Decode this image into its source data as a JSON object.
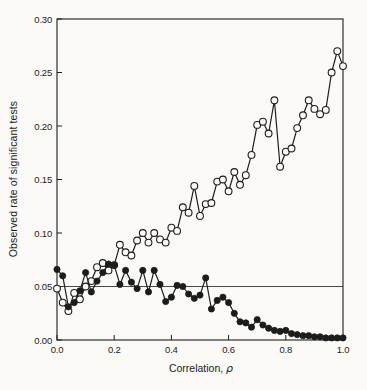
{
  "figure": {
    "background": "#fbfaf7",
    "ink_color": "#1c1c1c"
  },
  "axes": {
    "y_title": "Observed rate of significant tests",
    "x_title_prefix": "Correlation, ",
    "x_title_symbol": "ρ"
  },
  "chart_data": {
    "type": "line",
    "title": "",
    "xlabel": "Correlation, ρ",
    "ylabel": "Observed rate of significant tests",
    "xlim": [
      0.0,
      1.0
    ],
    "ylim": [
      0.0,
      0.3
    ],
    "grid": false,
    "legend": "none",
    "frame": "full-box",
    "reference_line_y": 0.05,
    "x_tick_values": [
      0.0,
      0.2,
      0.4,
      0.6,
      0.8,
      1.0
    ],
    "x_tick_labels": [
      "0.0",
      "0.2",
      "0.4",
      "0.6",
      "0.8",
      "1.0"
    ],
    "y_tick_values": [
      0.0,
      0.05,
      0.1,
      0.15,
      0.2,
      0.25,
      0.3
    ],
    "y_tick_labels": [
      "0.00",
      "0.05",
      "0.10",
      "0.15",
      "0.20",
      "0.25",
      "0.30"
    ],
    "series": [
      {
        "name": "increasing-series",
        "marker": "open-circle",
        "x": [
          0.0,
          0.02,
          0.04,
          0.06,
          0.08,
          0.1,
          0.12,
          0.14,
          0.16,
          0.18,
          0.2,
          0.22,
          0.24,
          0.26,
          0.28,
          0.3,
          0.32,
          0.34,
          0.36,
          0.38,
          0.4,
          0.42,
          0.44,
          0.46,
          0.48,
          0.5,
          0.52,
          0.54,
          0.56,
          0.58,
          0.6,
          0.62,
          0.64,
          0.66,
          0.68,
          0.7,
          0.72,
          0.74,
          0.76,
          0.78,
          0.8,
          0.82,
          0.84,
          0.86,
          0.88,
          0.9,
          0.92,
          0.94,
          0.96,
          0.98,
          1.0
        ],
        "values": [
          0.048,
          0.035,
          0.027,
          0.044,
          0.038,
          0.05,
          0.055,
          0.068,
          0.072,
          0.065,
          0.07,
          0.089,
          0.082,
          0.079,
          0.093,
          0.1,
          0.091,
          0.1,
          0.094,
          0.091,
          0.105,
          0.102,
          0.124,
          0.119,
          0.144,
          0.116,
          0.127,
          0.128,
          0.148,
          0.15,
          0.139,
          0.157,
          0.145,
          0.154,
          0.173,
          0.201,
          0.204,
          0.193,
          0.224,
          0.162,
          0.176,
          0.179,
          0.198,
          0.21,
          0.224,
          0.216,
          0.211,
          0.215,
          0.25,
          0.27,
          0.256
        ]
      },
      {
        "name": "decreasing-series",
        "marker": "filled-circle",
        "x": [
          0.0,
          0.02,
          0.04,
          0.06,
          0.08,
          0.1,
          0.12,
          0.14,
          0.16,
          0.18,
          0.2,
          0.22,
          0.24,
          0.26,
          0.28,
          0.3,
          0.32,
          0.34,
          0.36,
          0.38,
          0.4,
          0.42,
          0.44,
          0.46,
          0.48,
          0.5,
          0.52,
          0.54,
          0.56,
          0.58,
          0.6,
          0.62,
          0.64,
          0.66,
          0.68,
          0.7,
          0.72,
          0.74,
          0.76,
          0.78,
          0.8,
          0.82,
          0.84,
          0.86,
          0.88,
          0.9,
          0.92,
          0.94,
          0.96,
          0.98,
          1.0
        ],
        "values": [
          0.066,
          0.06,
          0.031,
          0.035,
          0.046,
          0.063,
          0.045,
          0.055,
          0.063,
          0.071,
          0.07,
          0.052,
          0.065,
          0.054,
          0.048,
          0.065,
          0.045,
          0.065,
          0.052,
          0.036,
          0.04,
          0.051,
          0.05,
          0.043,
          0.039,
          0.042,
          0.058,
          0.029,
          0.037,
          0.04,
          0.035,
          0.025,
          0.017,
          0.016,
          0.012,
          0.019,
          0.014,
          0.011,
          0.009,
          0.008,
          0.009,
          0.006,
          0.005,
          0.004,
          0.004,
          0.003,
          0.003,
          0.002,
          0.002,
          0.002,
          0.002
        ]
      }
    ]
  }
}
